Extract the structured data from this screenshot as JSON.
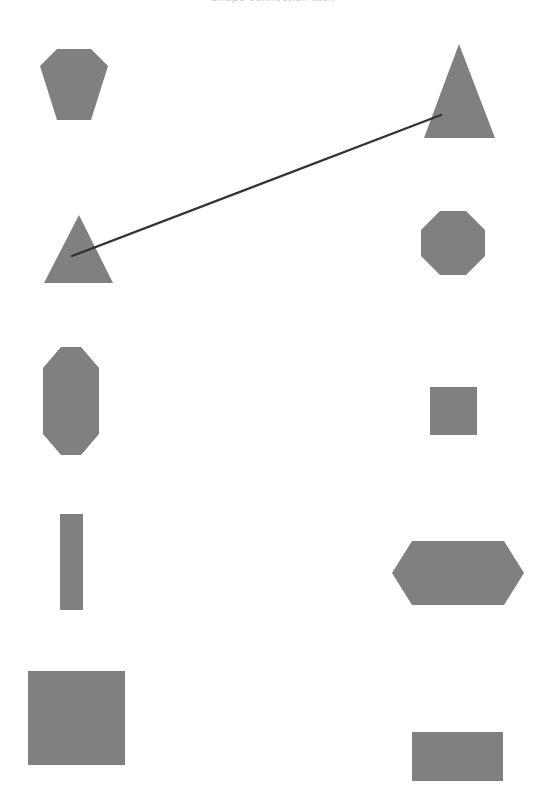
{
  "canvas": {
    "width": 545,
    "height": 810,
    "background_color": "#ffffff",
    "shape_fill_color": "#808080",
    "line_color": "#333333",
    "clipped_header_text": "Shape connection task"
  },
  "chart_data": {
    "type": "scatter",
    "title": "",
    "xlabel": "",
    "ylabel": "",
    "xlim": [
      0,
      545
    ],
    "ylim": [
      0,
      810
    ],
    "grid": false,
    "legend": null,
    "annotations": [
      {
        "kind": "connector-line",
        "from_shape_id": "triangle-left",
        "to_shape_id": "triangle-right",
        "x1": 72,
        "y1": 256,
        "x2": 441,
        "y2": 115,
        "stroke": "#333333",
        "stroke_width": 2.4,
        "linecap": "round"
      }
    ],
    "shapes": [
      {
        "id": "hexagon-top-left",
        "name": "hexagon",
        "sides": 6,
        "orientation": "flat-top",
        "fill": "#808080",
        "cx": 74,
        "cy": 85,
        "width": 80,
        "height": 72,
        "points": "40,66 57,49 91,49 108,66 91,120 57,120"
      },
      {
        "id": "triangle-right",
        "name": "triangle",
        "sides": 3,
        "orientation": "upright",
        "fill": "#808080",
        "cx": 459,
        "cy": 98,
        "width": 71,
        "height": 94,
        "points": "459,44 495,138 424,138"
      },
      {
        "id": "triangle-left",
        "name": "triangle",
        "sides": 3,
        "orientation": "upright",
        "fill": "#808080",
        "cx": 79,
        "cy": 250,
        "width": 69,
        "height": 68,
        "points": "79,215 113,283 44,283"
      },
      {
        "id": "octagon-right",
        "name": "octagon",
        "sides": 8,
        "orientation": "regular",
        "fill": "#808080",
        "cx": 453,
        "cy": 243,
        "width": 64,
        "height": 64,
        "points": "440,211 466,211 485,230 485,256 466,275 440,275 421,256 421,230"
      },
      {
        "id": "octagon-left-tall",
        "name": "octagon",
        "sides": 8,
        "orientation": "vertically-elongated",
        "fill": "#808080",
        "cx": 71,
        "cy": 401,
        "width": 55,
        "height": 108,
        "points": "61,347 81,347 99,368 99,434 81,455 61,455 43,434 43,368"
      },
      {
        "id": "square-right-small",
        "name": "square",
        "sides": 4,
        "orientation": "axis-aligned",
        "fill": "#808080",
        "cx": 453,
        "cy": 411,
        "width": 47,
        "height": 48,
        "points": "430,387 477,387 477,435 430,435"
      },
      {
        "id": "rectangle-left-narrow",
        "name": "rectangle",
        "sides": 4,
        "orientation": "vertical",
        "fill": "#808080",
        "cx": 71,
        "cy": 562,
        "width": 23,
        "height": 96,
        "points": "60,514 83,514 83,610 60,610"
      },
      {
        "id": "hexagon-right-wide",
        "name": "hexagon",
        "sides": 6,
        "orientation": "horizontally-elongated",
        "fill": "#808080",
        "cx": 458,
        "cy": 573,
        "width": 132,
        "height": 64,
        "points": "412,541 504,541 524,573 504,605 412,605 392,573"
      },
      {
        "id": "square-left-large",
        "name": "square",
        "sides": 4,
        "orientation": "axis-aligned",
        "fill": "#808080",
        "cx": 76,
        "cy": 718,
        "width": 97,
        "height": 94,
        "points": "28,671 125,671 125,765 28,765"
      },
      {
        "id": "rectangle-right-wide",
        "name": "rectangle",
        "sides": 4,
        "orientation": "horizontal",
        "fill": "#808080",
        "cx": 458,
        "cy": 757,
        "width": 91,
        "height": 49,
        "points": "412,732 503,732 503,781 412,781"
      }
    ]
  }
}
